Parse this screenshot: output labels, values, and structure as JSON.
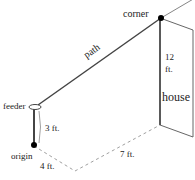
{
  "diagram": {
    "labels": {
      "corner": "corner",
      "path": "path",
      "feeder": "feeder",
      "origin": "origin",
      "house": "house",
      "height_feeder": "3 ft.",
      "dist_x": "4 ft.",
      "dist_y": "7 ft.",
      "height_house_num": "12",
      "height_house_unit": "ft."
    },
    "measurements": {
      "feeder_height_ft": 3,
      "origin_to_turn_ft": 4,
      "turn_to_house_ft": 7,
      "house_corner_height_ft": 12
    },
    "colors": {
      "line": "#444444",
      "dashed": "#888888",
      "dot": "#000000",
      "text": "#222222"
    }
  }
}
